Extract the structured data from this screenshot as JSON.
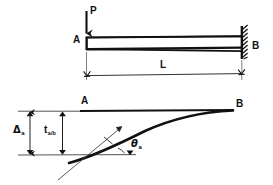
{
  "figure": {
    "background_color": "#ffffff",
    "line_color": "#111111",
    "width": 273,
    "height": 185
  },
  "top_diagram": {
    "name": "loaded-cantilever-beam",
    "load_label": "P",
    "left_node_label": "A",
    "right_node_label": "B",
    "span_label": "L",
    "support_type": "fixed-wall",
    "load_direction": "down"
  },
  "bottom_diagram": {
    "name": "deflected-shape",
    "left_node_label": "A",
    "right_node_label": "B",
    "deflection_label": "Δ",
    "deflection_subscript": "a",
    "tangential_deviation_label": "t",
    "tangential_deviation_subscript": "a/b",
    "slope_label": "θ",
    "slope_subscript": "a"
  }
}
